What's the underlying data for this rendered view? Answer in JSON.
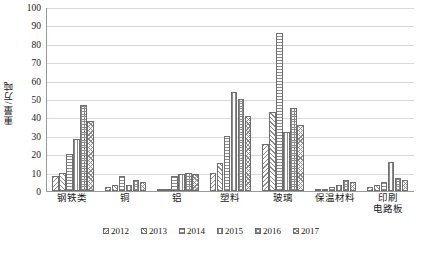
{
  "chart_data": {
    "type": "bar",
    "title": "",
    "subtitle": "",
    "xlabel": "",
    "ylabel": "重量/万吨",
    "ylim": [
      0,
      100
    ],
    "ytick_step": 10,
    "yticks": [
      100,
      90,
      80,
      70,
      60,
      50,
      40,
      30,
      20,
      10,
      0
    ],
    "grid": "horizontal",
    "legend_position": "bottom",
    "categories": [
      "钢铁类",
      "铜",
      "铝",
      "塑料",
      "玻璃",
      "保温材料",
      "印刷\n电路板"
    ],
    "series": [
      {
        "name": "2012",
        "pattern": "diagonal-backslash",
        "values": [
          8,
          2,
          0.5,
          10,
          25.5,
          0.5,
          2
        ]
      },
      {
        "name": "2013",
        "pattern": "diagonal-slash",
        "values": [
          10,
          3,
          1,
          15,
          43,
          1,
          3
        ]
      },
      {
        "name": "2014",
        "pattern": "horizontal-lines",
        "values": [
          20,
          8,
          8,
          30,
          86,
          2,
          5
        ]
      },
      {
        "name": "2015",
        "pattern": "vertical-lines",
        "values": [
          28,
          3,
          9,
          54,
          32,
          3,
          16
        ]
      },
      {
        "name": "2016",
        "pattern": "grid-crosshatch",
        "values": [
          47,
          6,
          10,
          50,
          45,
          6,
          7
        ]
      },
      {
        "name": "2017",
        "pattern": "diagonal-crosshatch",
        "values": [
          38,
          5,
          9,
          40.5,
          36,
          5,
          6
        ]
      }
    ]
  },
  "colors": {
    "axis": "#9a9a9a",
    "gridline": "#d9d9d9",
    "bar_outline": "#6f6f6f",
    "bar_fill": "#ffffff",
    "hatch": "#8a8a8a",
    "text": "#1a1a1a",
    "background": "#ffffff"
  }
}
